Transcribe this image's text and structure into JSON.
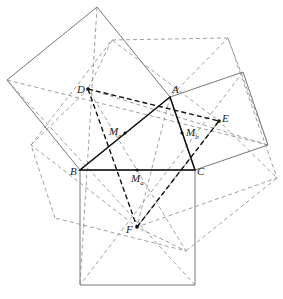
{
  "figure": {
    "points": {
      "A": [
        170,
        97
      ],
      "B": [
        80,
        170
      ],
      "C": [
        195,
        170
      ],
      "D": [
        88,
        89
      ],
      "E": [
        219,
        121
      ],
      "F": [
        137,
        227
      ],
      "Ma": [
        137,
        170
      ],
      "Mb": [
        182,
        133
      ],
      "Mc": [
        125,
        133
      ]
    },
    "labels": [
      {
        "id": "A",
        "text": "A",
        "x": 172,
        "y": 84
      },
      {
        "id": "B",
        "text": "B",
        "x": 70,
        "y": 168
      },
      {
        "id": "C",
        "text": "C",
        "x": 196,
        "y": 168
      },
      {
        "id": "D",
        "text": "D",
        "x": 78,
        "y": 83
      },
      {
        "id": "E",
        "text": "E",
        "x": 222,
        "y": 113
      },
      {
        "id": "F",
        "text": "F",
        "x": 126,
        "y": 226
      },
      {
        "id": "Ma",
        "text": "M",
        "sub": "a",
        "x": 130,
        "y": 173
      },
      {
        "id": "Mb",
        "text": "M",
        "sub": "b",
        "x": 185,
        "y": 127
      },
      {
        "id": "Mc",
        "text": "M",
        "sub": "c",
        "x": 108,
        "y": 126
      }
    ],
    "colors": {
      "solid": "#555555",
      "dashed": "#777777",
      "bold": "#111111"
    }
  }
}
